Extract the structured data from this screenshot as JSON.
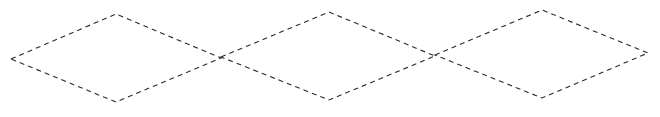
{
  "canvas": {
    "width": 660,
    "height": 117,
    "background": "#ffffff"
  },
  "style": {
    "stroke_color": "#2a2a2a",
    "dash_pattern": "5 4"
  },
  "diamonds": [
    {
      "id": "diamond-1",
      "left": [
        11,
        59
      ],
      "top": [
        116,
        14
      ],
      "right": [
        221,
        58
      ],
      "bottom": [
        116,
        102
      ]
    },
    {
      "id": "diamond-2",
      "left": [
        221,
        57
      ],
      "top": [
        329,
        12
      ],
      "right": [
        435,
        56
      ],
      "bottom": [
        329,
        100
      ]
    },
    {
      "id": "diamond-3",
      "left": [
        435,
        55
      ],
      "top": [
        542,
        10
      ],
      "right": [
        648,
        53
      ],
      "bottom": [
        542,
        98
      ]
    }
  ]
}
